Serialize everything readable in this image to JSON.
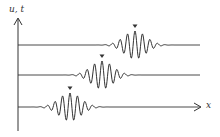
{
  "figure": {
    "y_axis_label": "u, t",
    "x_axis_label": "x",
    "line_color": "#333333",
    "marker_symbol": "▼"
  },
  "chart_data": {
    "type": "line",
    "title": "",
    "xlabel": "x",
    "ylabel": "u, t",
    "series": [
      {
        "name": "trace-top",
        "baseline_y": 45,
        "packet_center_x": 135,
        "marker_x": 135
      },
      {
        "name": "trace-middle",
        "baseline_y": 75,
        "packet_center_x": 102,
        "marker_x": 102
      },
      {
        "name": "trace-bottom",
        "baseline_y": 107,
        "packet_center_x": 70,
        "marker_x": 70
      }
    ],
    "grid": false
  }
}
